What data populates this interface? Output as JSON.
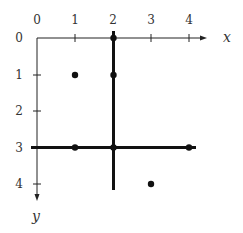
{
  "diagram": {
    "x_axis": {
      "label": "x",
      "ticks": [
        "0",
        "1",
        "2",
        "3",
        "4"
      ]
    },
    "y_axis": {
      "label": "y",
      "ticks": [
        "0",
        "1",
        "2",
        "3",
        "4"
      ]
    },
    "thick_lines": [
      {
        "orientation": "vertical",
        "x": 2,
        "y_from": -0.2,
        "y_to": 4.2
      },
      {
        "orientation": "horizontal",
        "y": 3,
        "x_from": -0.15,
        "x_to": 4.2
      }
    ],
    "points": [
      {
        "x": 2,
        "y": 0
      },
      {
        "x": 1,
        "y": 1
      },
      {
        "x": 2,
        "y": 1
      },
      {
        "x": 1,
        "y": 3
      },
      {
        "x": 2,
        "y": 3
      },
      {
        "x": 4,
        "y": 3
      },
      {
        "x": 3,
        "y": 4
      }
    ],
    "colors": {
      "ink": "#111111",
      "label": "#333333",
      "background": "#ffffff"
    }
  }
}
